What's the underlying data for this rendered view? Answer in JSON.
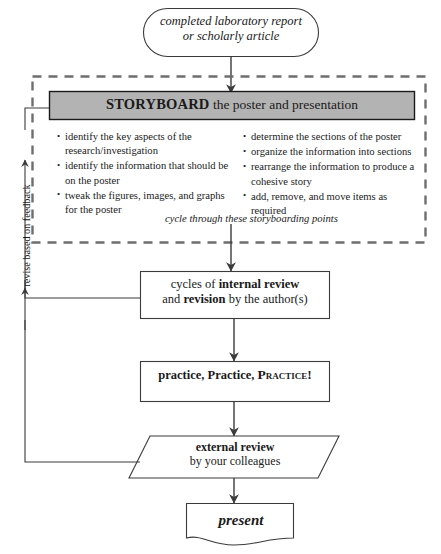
{
  "diagram": {
    "colors": {
      "stroke": "#3b3b3b",
      "header_fill": "#b3b3b3",
      "text": "#1a1a1a",
      "dashed_border": "#6e6e6e"
    }
  },
  "start_node": {
    "shape": "oval",
    "line1": "completed laboratory report",
    "line2": "or scholarly article"
  },
  "storyboard_group": {
    "border_style": "dashed",
    "header": {
      "shape": "filled-rectangle",
      "emphasis": "STORYBOARD",
      "rest": " the poster and presentation"
    },
    "bullets_left": [
      "identify the key aspects of the research/investigation",
      "identify the information that should be on the poster",
      "tweak the figures, images, and graphs for the poster"
    ],
    "bullets_right": [
      "determine the sections of the poster",
      "organize the information into sections",
      "rearrange the information to produce a cohesive story",
      "add, remove, and move items as required"
    ],
    "caption": "cycle through these storyboarding points"
  },
  "internal_review": {
    "shape": "rectangle",
    "line1_pre": "cycles of ",
    "line1_bold": "internal review",
    "line2_pre": "and ",
    "line2_bold": "revision",
    "line2_post": " by the author(s)"
  },
  "practice": {
    "shape": "rectangle",
    "part1": "practice, Practice, ",
    "part2_smallcaps": "Practice!"
  },
  "external_review": {
    "shape": "parallelogram",
    "line1": "external review",
    "line2": "by your colleagues"
  },
  "present": {
    "shape": "document",
    "label": "present"
  },
  "feedback_loop": {
    "label": "revise based on feedback",
    "orientation": "vertical-rotated",
    "arrowheads": 2
  }
}
